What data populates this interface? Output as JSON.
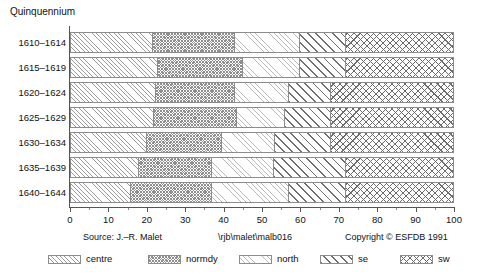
{
  "chart_data": {
    "type": "bar",
    "orientation": "horizontal",
    "stacked": true,
    "normalized_percent": true,
    "title": "Quinquennium",
    "xlabel": "",
    "ylabel": "Quinquennium",
    "xlim": [
      0,
      100
    ],
    "xtick_step": 10,
    "xtick_minor_step": 5,
    "grid": false,
    "legend_position": "bottom",
    "categories": [
      "1610–1614",
      "1615–1619",
      "1620–1624",
      "1625–1629",
      "1630–1634",
      "1635–1639",
      "1640–1644"
    ],
    "xticklabels": [
      "0",
      "10",
      "20",
      "30",
      "40",
      "50",
      "60",
      "70",
      "80",
      "90",
      "100"
    ],
    "xtickvalues": [
      0,
      10,
      20,
      30,
      40,
      50,
      60,
      70,
      80,
      90,
      100
    ],
    "series": [
      {
        "name": "centre",
        "pattern": "diagonal-hatch-light",
        "values": [
          21.5,
          23.0,
          22.5,
          22.0,
          20.0,
          18.0,
          16.0
        ]
      },
      {
        "name": "normdy",
        "pattern": "cross-hatch-fine",
        "values": [
          21.5,
          22.0,
          20.5,
          21.5,
          19.5,
          19.0,
          21.0
        ]
      },
      {
        "name": "north",
        "pattern": "diagonal-hatch-faint",
        "values": [
          17.0,
          15.0,
          14.0,
          12.5,
          14.0,
          16.0,
          20.0
        ]
      },
      {
        "name": "se",
        "pattern": "diagonal-hatch-bold",
        "values": [
          12.0,
          12.0,
          11.0,
          12.0,
          14.5,
          19.0,
          15.0
        ]
      },
      {
        "name": "sw",
        "pattern": "cross-hatch-bold",
        "values": [
          28.0,
          28.0,
          32.0,
          32.0,
          32.0,
          28.0,
          28.0
        ]
      }
    ],
    "cumulative_boundaries": [
      [
        21.5,
        43.0,
        60.0,
        72.0,
        100
      ],
      [
        23.0,
        45.0,
        60.0,
        72.0,
        100
      ],
      [
        22.5,
        43.0,
        57.0,
        68.0,
        100
      ],
      [
        22.0,
        43.5,
        56.0,
        68.0,
        100
      ],
      [
        20.0,
        39.5,
        53.5,
        68.0,
        100
      ],
      [
        18.0,
        37.0,
        53.0,
        72.0,
        100
      ],
      [
        16.0,
        37.0,
        57.0,
        72.0,
        100
      ]
    ]
  },
  "legend": {
    "entries": [
      {
        "label": "centre",
        "swatch": "centre-swatch-icon"
      },
      {
        "label": "normdy",
        "swatch": "normdy-swatch-icon"
      },
      {
        "label": "north",
        "swatch": "north-swatch-icon"
      },
      {
        "label": "se",
        "swatch": "se-swatch-icon"
      },
      {
        "label": "sw",
        "swatch": "sw-swatch-icon"
      }
    ]
  },
  "footer": {
    "source": "Source: J.–R. Malet",
    "path": "\\rjb\\malet\\malb016",
    "copyright": "Copyright © ESFDB 1991"
  },
  "colors": {
    "axis": "#555555",
    "text": "#111111",
    "pattern_dark": "#6b6b6b",
    "pattern_mid": "#8e8e8e",
    "pattern_light": "#b9b9b9",
    "background": "#ffffff"
  }
}
